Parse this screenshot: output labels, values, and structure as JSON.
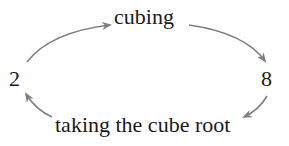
{
  "diagram": {
    "nodes": {
      "left": "2",
      "right": "8"
    },
    "edges": {
      "top": "cubing",
      "bottom": "taking the cube root"
    },
    "colors": {
      "text": "#1a1a1a",
      "arrow": "#808080",
      "background": "#ffffff"
    }
  }
}
